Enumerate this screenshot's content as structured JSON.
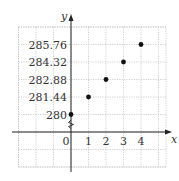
{
  "chart_data": {
    "type": "scatter",
    "title": "",
    "xlabel": "x",
    "ylabel": "y",
    "x": [
      0,
      1,
      2,
      3,
      4
    ],
    "y": [
      280,
      281.44,
      282.88,
      284.32,
      285.76
    ],
    "x_tick_labels": [
      "0",
      "1",
      "2",
      "3",
      "4"
    ],
    "y_tick_labels": [
      "280",
      "281.44",
      "282.88",
      "284.32",
      "285.76"
    ],
    "y_axis_break": true,
    "grid": true,
    "grid_style": "dotted",
    "legend": null,
    "point_color": "#111111"
  }
}
